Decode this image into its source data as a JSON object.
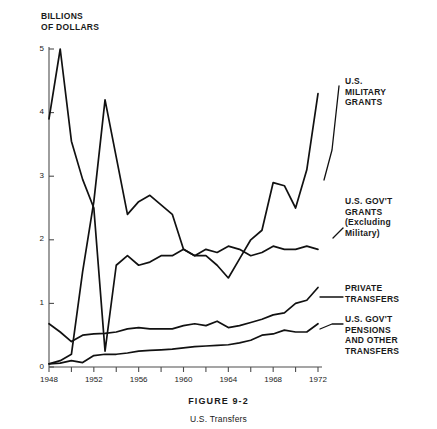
{
  "figure": {
    "caption_title": "FIGURE 9-2",
    "caption_subtitle": "U.S. Transfers"
  },
  "chart_data": {
    "type": "line",
    "title": "U.S. Transfers",
    "subtitle": "FIGURE 9-2",
    "xlabel": "",
    "ylabel": "BILLIONS\nOF DOLLARS",
    "ylabel_line1": "BILLIONS",
    "ylabel_line2": "OF DOLLARS",
    "xlim": [
      1948,
      1972
    ],
    "ylim": [
      0,
      5
    ],
    "yticks": [
      0,
      1,
      2,
      3,
      4,
      5
    ],
    "ytick_labels": [
      "0",
      "1",
      "2",
      "3",
      "4",
      "5"
    ],
    "xticks": [
      1948,
      1950,
      1952,
      1954,
      1956,
      1958,
      1960,
      1962,
      1964,
      1966,
      1968,
      1970,
      1972
    ],
    "xtick_labels_shown": [
      "1948",
      "1952",
      "1956",
      "1960",
      "1964",
      "1968",
      "1972"
    ],
    "grid": false,
    "legend_position": "right-inline-annotations",
    "x": [
      1948,
      1949,
      1950,
      1951,
      1952,
      1953,
      1954,
      1955,
      1956,
      1957,
      1958,
      1959,
      1960,
      1961,
      1962,
      1963,
      1964,
      1965,
      1966,
      1967,
      1968,
      1969,
      1970,
      1971,
      1972
    ],
    "series": [
      {
        "name": "U.S. MILITARY GRANTS",
        "label_lines": [
          "U.S.",
          "MILITARY",
          "GRANTS"
        ],
        "values": [
          0.05,
          0.1,
          0.2,
          1.5,
          2.6,
          4.2,
          3.3,
          2.4,
          2.6,
          2.7,
          2.55,
          2.4,
          1.85,
          1.75,
          1.75,
          1.6,
          1.4,
          1.7,
          2.0,
          2.15,
          2.9,
          2.85,
          2.5,
          3.1,
          4.3
        ]
      },
      {
        "name": "U.S. GOV'T GRANTS (Excluding Military)",
        "label_lines": [
          "U.S. GOV'T",
          "GRANTS",
          "(Excluding",
          "Military)"
        ],
        "values": [
          3.9,
          5.0,
          3.55,
          2.95,
          2.5,
          0.25,
          1.6,
          1.75,
          1.6,
          1.65,
          1.75,
          1.75,
          1.85,
          1.75,
          1.85,
          1.8,
          1.9,
          1.85,
          1.75,
          1.8,
          1.9,
          1.85,
          1.85,
          1.9,
          1.85
        ]
      },
      {
        "name": "PRIVATE TRANSFERS",
        "label_lines": [
          "PRIVATE",
          "TRANSFERS"
        ],
        "values": [
          0.68,
          0.55,
          0.4,
          0.5,
          0.52,
          0.53,
          0.55,
          0.6,
          0.62,
          0.6,
          0.6,
          0.6,
          0.65,
          0.68,
          0.65,
          0.72,
          0.62,
          0.65,
          0.7,
          0.75,
          0.82,
          0.85,
          1.0,
          1.05,
          1.25
        ]
      },
      {
        "name": "U.S. GOV'T PENSIONS AND OTHER TRANSFERS",
        "label_lines": [
          "U.S. GOV'T",
          "PENSIONS",
          "AND OTHER",
          "TRANSFERS"
        ],
        "values": [
          0.05,
          0.06,
          0.1,
          0.07,
          0.18,
          0.2,
          0.2,
          0.22,
          0.25,
          0.26,
          0.27,
          0.28,
          0.3,
          0.32,
          0.33,
          0.34,
          0.35,
          0.38,
          0.42,
          0.5,
          0.52,
          0.58,
          0.55,
          0.55,
          0.68
        ]
      }
    ],
    "colors": {
      "line": "#111111",
      "axis": "#4d4d4d",
      "background": "#ffffff"
    }
  }
}
